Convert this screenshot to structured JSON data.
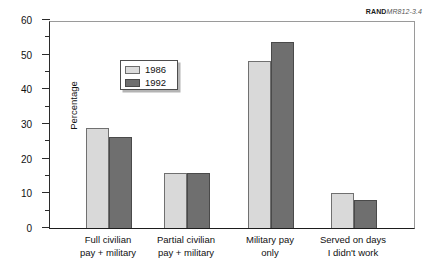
{
  "source_credit": {
    "brand": "RAND",
    "document_id": "MR812-3.4"
  },
  "legend": {
    "entries": [
      {
        "label": "1986",
        "color": "#d9d9d9",
        "swatch": "legend-swatch-1986"
      },
      {
        "label": "1992",
        "color": "#6f6f6f",
        "swatch": "legend-swatch-1992"
      }
    ]
  },
  "axes": {
    "y_title": "Percentage",
    "y_ticks": [
      "0",
      "10",
      "20",
      "30",
      "40",
      "50",
      "60"
    ]
  },
  "chart_data": {
    "type": "bar",
    "title": "",
    "xlabel": "",
    "ylabel": "Percentage",
    "ylim": [
      0,
      60
    ],
    "ytick_step": 10,
    "yminor_tick_step": 5,
    "grid": false,
    "legend_position": "upper-left-inside",
    "categories": [
      "Full civilian\npay + military",
      "Partial civilian\npay + military",
      "Military pay\nonly",
      "Served on days\nI didn't work"
    ],
    "series": [
      {
        "name": "1986",
        "color": "#d9d9d9",
        "values": [
          28.8,
          15.8,
          48.2,
          10.2
        ]
      },
      {
        "name": "1992",
        "color": "#6f6f6f",
        "values": [
          26.3,
          15.8,
          53.6,
          8.1
        ]
      }
    ]
  }
}
